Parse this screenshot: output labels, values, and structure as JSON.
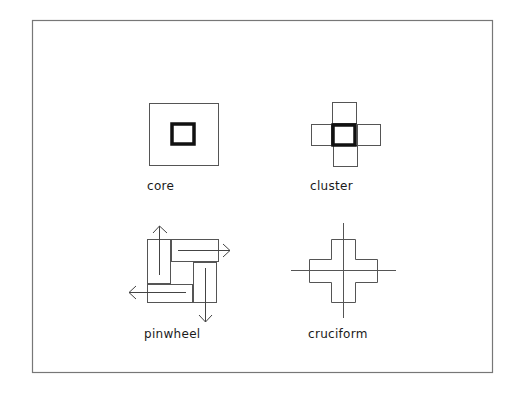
{
  "diagram": {
    "panels": [
      {
        "id": "core",
        "label": "core"
      },
      {
        "id": "cluster",
        "label": "cluster"
      },
      {
        "id": "pinwheel",
        "label": "pinwheel"
      },
      {
        "id": "cruciform",
        "label": "cruciform"
      }
    ],
    "colors": {
      "line": "#555555",
      "thick_line": "#111111",
      "frame": "#777777",
      "background": "#ffffff"
    }
  }
}
